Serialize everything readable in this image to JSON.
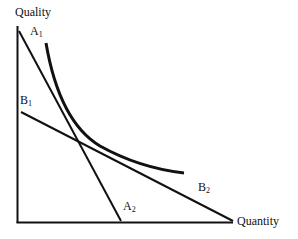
{
  "diagram": {
    "axes": {
      "y_label": "Quality",
      "x_label": "Quantity"
    },
    "lines": [
      {
        "id": "A",
        "start_label": "A",
        "start_sub": "1",
        "end_label": "A",
        "end_sub": "2",
        "from": [
          19,
          31
        ],
        "to": [
          121,
          221
        ]
      },
      {
        "id": "B",
        "start_label": "B",
        "start_sub": "1",
        "end_label": "B",
        "end_sub": "2",
        "from": [
          21,
          112
        ],
        "to": [
          233,
          221
        ]
      }
    ],
    "curve": {
      "name": "indifference-curve",
      "from": [
        46,
        43
      ],
      "to": [
        184,
        173
      ]
    },
    "colors": {
      "stroke": "#111111",
      "background": "#ffffff"
    }
  }
}
